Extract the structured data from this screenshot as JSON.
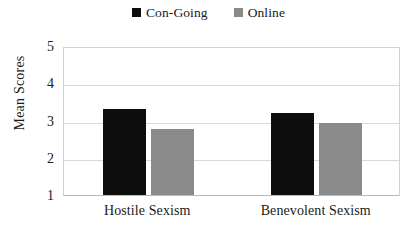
{
  "chart_data": {
    "type": "bar",
    "title": "",
    "subtitle": "",
    "xlabel": "",
    "ylabel": "Mean Scores",
    "categories": [
      "Hostile Sexism",
      "Benevolent Sexism"
    ],
    "series": [
      {
        "name": "Con-Going",
        "color": "#0d0d0d",
        "values": [
          3.3,
          3.2
        ]
      },
      {
        "name": "Online",
        "color": "#8a8a8a",
        "values": [
          2.77,
          2.93
        ]
      }
    ],
    "ylim": [
      1,
      5
    ],
    "yticks": [
      5,
      4,
      3,
      2,
      1
    ],
    "ytick_labels": [
      "5",
      "4",
      "3",
      "2",
      "1"
    ],
    "grid": true,
    "grid_axis": "y",
    "legend_position": "top-center",
    "legend": [
      {
        "label": "Con-Going",
        "color": "#0d0d0d",
        "marker": "square"
      },
      {
        "label": "Online",
        "color": "#8a8a8a",
        "marker": "square"
      }
    ]
  }
}
